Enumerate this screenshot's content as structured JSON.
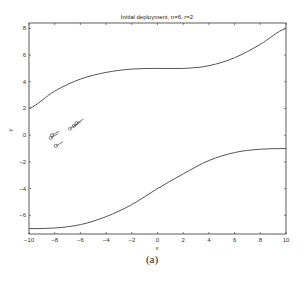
{
  "figure": {
    "caption": "(a)"
  },
  "chart_data": {
    "type": "line",
    "title": "Initial deployment, n=6, r=2",
    "xlabel": "x",
    "ylabel": "y",
    "xlim": [
      -10,
      10
    ],
    "ylim": [
      -7.4,
      8.4
    ],
    "xticks": [
      -10,
      -8,
      -6,
      -4,
      -2,
      0,
      2,
      4,
      6,
      8,
      10
    ],
    "yticks": [
      -6,
      -4,
      -2,
      0,
      2,
      4,
      6,
      8
    ],
    "grid": false,
    "series": [
      {
        "name": "upper boundary",
        "x": [
          -10,
          -8,
          -6,
          -4,
          -2,
          0,
          2,
          4,
          6,
          8,
          10
        ],
        "y": [
          2,
          3.3,
          4.2,
          4.7,
          4.95,
          5,
          5,
          5.2,
          5.8,
          6.8,
          8
        ]
      },
      {
        "name": "lower boundary",
        "x": [
          -10,
          -8,
          -6,
          -4,
          -2,
          0,
          2,
          4,
          6,
          8,
          10
        ],
        "y": [
          -7,
          -6.95,
          -6.7,
          -6.1,
          -5.2,
          -4,
          -2.9,
          -1.9,
          -1.3,
          -1.05,
          -1
        ]
      }
    ],
    "robots": {
      "count": 6,
      "positions": [
        [
          -8.2,
          0
        ],
        [
          -8.3,
          -0.2
        ],
        [
          -7.9,
          -0.8
        ],
        [
          -6.5,
          0.7
        ],
        [
          -6.8,
          0.5
        ],
        [
          -6.3,
          0.9
        ]
      ]
    }
  }
}
